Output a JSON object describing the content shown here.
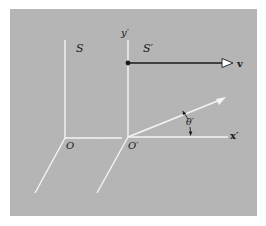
{
  "figure": {
    "background_color": "#b4b4b4",
    "axis_color": "#f4f4f4",
    "ink_color": "#1a1a1a",
    "labels": {
      "frame_s": "S",
      "frame_s_prime": "S′",
      "y_prime": "y′",
      "x_prime": "x′",
      "velocity": "v",
      "origin_o": "O",
      "origin_o_prime": "O′",
      "angle_theta_prime": "θ′"
    }
  }
}
